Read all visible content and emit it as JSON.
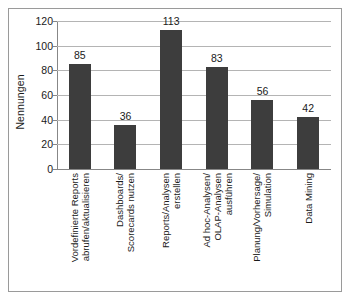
{
  "chart_data": {
    "type": "bar",
    "title": "",
    "subtitle": "",
    "xlabel": "",
    "ylabel": "Nennungen",
    "ylim": [
      0,
      120
    ],
    "ytick_step": 20,
    "yticks": [
      120,
      100,
      80,
      60,
      40,
      20,
      0
    ],
    "grid": true,
    "legend": false,
    "legend_position": "none",
    "categories": [
      "Vordefinierte Reports abrufen/aktualisieren",
      "Dashboards/ Scorecards nutzen",
      "Reports/Analysen erstellen",
      "Ad hoc-Analysen/ OLAP-Analysen ausführen",
      "Planung/Vorhersage/ Simulation",
      "Data Mining"
    ],
    "category_lines": [
      [
        "Vordefinierte Reports",
        "abrufen/aktualisieren"
      ],
      [
        "Dashboards/",
        "Scorecards nutzen"
      ],
      [
        "Reports/Analysen",
        "erstellen"
      ],
      [
        "Ad hoc-Analysen/",
        "OLAP-Analysen",
        "ausführen"
      ],
      [
        "Planung/Vorhersage/",
        "Simulation"
      ],
      [
        "Data Mining"
      ]
    ],
    "values": [
      85,
      36,
      113,
      83,
      56,
      42
    ],
    "value_labels": [
      "85",
      "36",
      "113",
      "83",
      "56",
      "42"
    ],
    "bar_color": "#3d3d3d",
    "gridline_color": "#b4b4b4",
    "axis_color": "#878787",
    "border_color": "#9a9a9a",
    "background_color": "#ffffff",
    "text_color": "#1a1a1a"
  }
}
